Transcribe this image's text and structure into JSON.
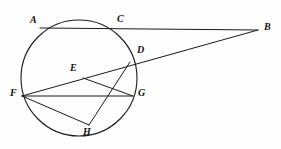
{
  "figure": {
    "kind": "circle-geometry-diagram",
    "width": 281,
    "height": 149,
    "background_color": "#fefefe",
    "stroke_color": "#1a1a1a",
    "label_color": "#111111",
    "circle": {
      "cx": 79,
      "cy": 78,
      "r": 58
    },
    "points": [
      {
        "id": "A",
        "label": "A",
        "x": 40,
        "y": 28,
        "label_x": 30,
        "label_y": 15
      },
      {
        "id": "B",
        "label": "B",
        "x": 258,
        "y": 30,
        "label_x": 264,
        "label_y": 22
      },
      {
        "id": "C",
        "label": "C",
        "x": 121,
        "y": 28,
        "label_x": 117,
        "label_y": 14
      },
      {
        "id": "D",
        "label": "D",
        "x": 130,
        "y": 62,
        "label_x": 137,
        "label_y": 45
      },
      {
        "id": "E",
        "label": "E",
        "x": 83,
        "y": 78,
        "label_x": 70,
        "label_y": 63
      },
      {
        "id": "F",
        "label": "F",
        "x": 22,
        "y": 96,
        "label_x": 10,
        "label_y": 88
      },
      {
        "id": "G",
        "label": "G",
        "x": 133,
        "y": 96,
        "label_x": 138,
        "label_y": 88
      },
      {
        "id": "H",
        "label": "H",
        "x": 89,
        "y": 125,
        "label_x": 83,
        "label_y": 127
      }
    ],
    "segments": [
      {
        "id": "AB",
        "from": "A",
        "to": "B",
        "note": "secant through C"
      },
      {
        "id": "FB",
        "from": "F",
        "to": "B",
        "note": "secant through E and D"
      },
      {
        "id": "FG",
        "from": "F",
        "to": "G",
        "note": "chord"
      },
      {
        "id": "FH",
        "from": "F",
        "to": "H",
        "note": "chord"
      },
      {
        "id": "EG",
        "from": "E",
        "to": "G",
        "note": "segment"
      },
      {
        "id": "DH",
        "from": "D",
        "to": "H",
        "note": "chord"
      }
    ]
  }
}
